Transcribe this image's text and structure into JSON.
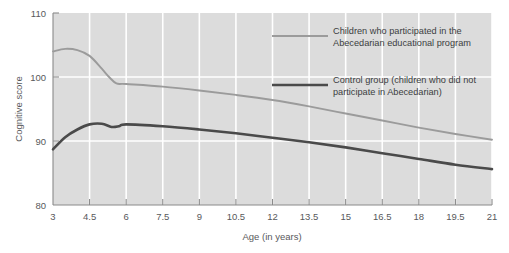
{
  "chart_data": {
    "type": "line",
    "title": "",
    "xlabel": "Age (in years)",
    "ylabel": "Cognitive score",
    "xlim": [
      3,
      21
    ],
    "ylim": [
      80,
      110
    ],
    "grid": true,
    "legend_position": "upper-right",
    "xticks": [
      "3",
      "4.5",
      "6",
      "7.5",
      "9",
      "10.5",
      "12",
      "13.5",
      "15",
      "16.5",
      "18",
      "19.5",
      "21"
    ],
    "yticks": [
      "80",
      "90",
      "100",
      "110"
    ],
    "colors": {
      "series1": "#9b9b9b",
      "series2": "#4a4a4a",
      "plot_bg": "#dcdcdc",
      "grid": "#ffffff",
      "axis": "#8a8a8a"
    },
    "series": [
      {
        "name": "Children who participated in the Abecedarian educational program",
        "color": "#9b9b9b",
        "x": [
          3,
          3.5,
          4,
          4.5,
          5,
          5.3,
          5.6,
          6,
          7.5,
          9,
          10.5,
          12,
          13.5,
          15,
          16.5,
          18,
          19.5,
          21
        ],
        "values": [
          104.0,
          104.4,
          104.2,
          103.3,
          101.3,
          100.0,
          99.0,
          98.9,
          98.5,
          97.9,
          97.2,
          96.4,
          95.4,
          94.3,
          93.2,
          92.1,
          91.1,
          90.2
        ]
      },
      {
        "name": "Control group (children who did not participate in Abecedarian)",
        "color": "#4a4a4a",
        "x": [
          3,
          3.5,
          4,
          4.5,
          5,
          5.4,
          5.7,
          6,
          7.5,
          9,
          10.5,
          12,
          13.5,
          15,
          16.5,
          18,
          19.5,
          21
        ],
        "values": [
          88.7,
          90.6,
          91.8,
          92.6,
          92.7,
          92.2,
          92.3,
          92.6,
          92.3,
          91.8,
          91.2,
          90.5,
          89.8,
          89.0,
          88.1,
          87.2,
          86.3,
          85.6
        ]
      }
    ],
    "legend_entries": [
      {
        "label_line1": "Children who participated in the",
        "label_line2": "Abecedarian educational program",
        "color": "#9b9b9b",
        "weight": "thin"
      },
      {
        "label_line1": "Control group (children who did not",
        "label_line2": "participate in Abecedarian)",
        "color": "#4a4a4a",
        "weight": "thick"
      }
    ]
  }
}
